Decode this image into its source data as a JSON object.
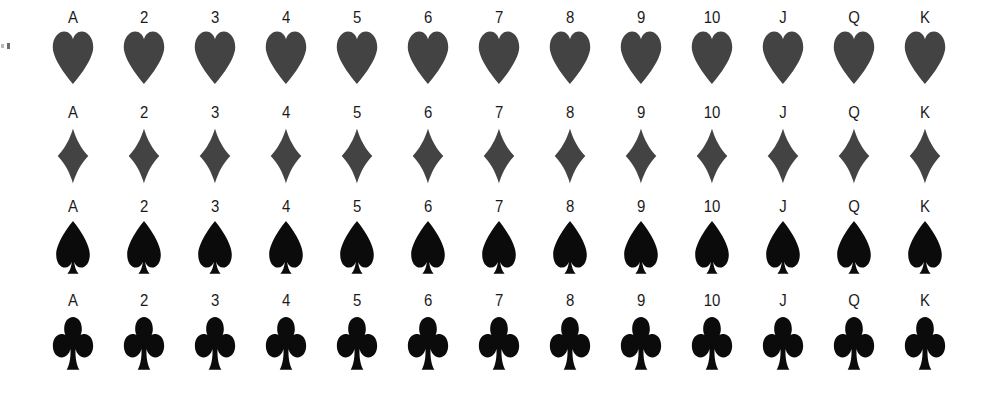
{
  "sheet": {
    "title": "Playing card rank and suit chart",
    "background_color": "#ffffff",
    "width": 995,
    "height": 397,
    "columns": 13,
    "rows": 4
  },
  "edge_artifact": {
    "name": "scan-edge-marks",
    "description": "..."
  },
  "ranks": [
    "A",
    "2",
    "3",
    "4",
    "5",
    "6",
    "7",
    "8",
    "9",
    "10",
    "J",
    "Q",
    "K"
  ],
  "suits": [
    {
      "key": "hearts",
      "name": "Hearts",
      "icon": "heart-icon",
      "color": "#434343",
      "ranks": [
        "A",
        "2",
        "3",
        "4",
        "5",
        "6",
        "7",
        "8",
        "9",
        "10",
        "J",
        "Q",
        "K"
      ]
    },
    {
      "key": "diamonds",
      "name": "Diamonds",
      "icon": "diamond-icon",
      "color": "#434343",
      "ranks": [
        "A",
        "2",
        "3",
        "4",
        "5",
        "6",
        "7",
        "8",
        "9",
        "10",
        "J",
        "Q",
        "K"
      ]
    },
    {
      "key": "spades",
      "name": "Spades",
      "icon": "spade-icon",
      "color": "#0b0b0b",
      "ranks": [
        "A",
        "2",
        "3",
        "4",
        "5",
        "6",
        "7",
        "8",
        "9",
        "10",
        "J",
        "Q",
        "K"
      ]
    },
    {
      "key": "clubs",
      "name": "Clubs",
      "icon": "club-icon",
      "color": "#0b0b0b",
      "ranks": [
        "A",
        "2",
        "3",
        "4",
        "5",
        "6",
        "7",
        "8",
        "9",
        "10",
        "J",
        "Q",
        "K"
      ]
    }
  ],
  "layout": {
    "first_column_center_x": 73,
    "column_spacing": 71
  }
}
